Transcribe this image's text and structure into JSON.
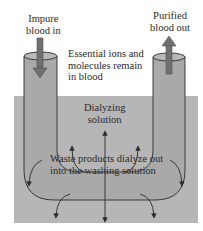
{
  "diagram": {
    "labels": {
      "impure_in": [
        "Impure",
        "blood in"
      ],
      "purified_out": [
        "Purified",
        "blood out"
      ],
      "essential": [
        "Essential ions and",
        "molecules remain",
        "in blood"
      ],
      "dialyzing": [
        "Dialyzing",
        "solution"
      ],
      "waste": [
        "Waste products dialyze out",
        "into the washing solution"
      ]
    },
    "colors": {
      "bath": "#b4b4b4",
      "tube": "#a8a8a8",
      "arrow": "#6e6e6e",
      "line": "#2a2a2a",
      "background": "#ffffff"
    }
  }
}
